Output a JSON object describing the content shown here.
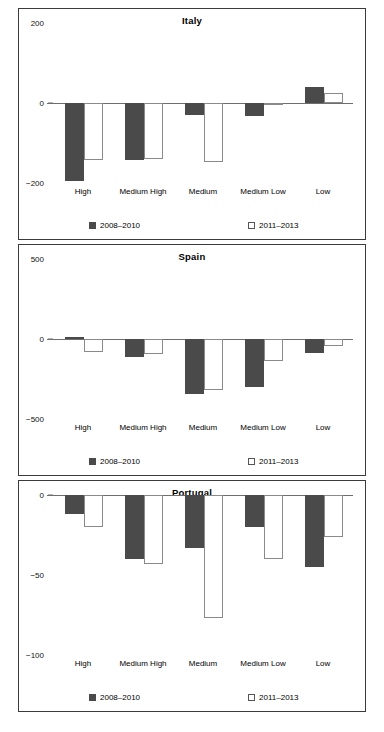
{
  "chart_data": [
    {
      "type": "bar",
      "title": "Italy",
      "categories": [
        "High",
        "Medium High",
        "Medium",
        "Medium Low",
        "Low"
      ],
      "series": [
        {
          "name": "2008–2010",
          "values": [
            -195,
            -142,
            -30,
            -32,
            40
          ],
          "color": "#4a4a4a",
          "fill": "solid"
        },
        {
          "name": "2011–2013",
          "values": [
            -142,
            -140,
            -148,
            -6,
            25
          ],
          "color": "#ffffff",
          "fill": "hollow"
        }
      ],
      "yticks": [
        200,
        0,
        -200
      ],
      "yticklabels": [
        "200",
        "0",
        "−200"
      ],
      "ylim": [
        -200,
        200
      ],
      "xlabel": "",
      "ylabel": "",
      "grid": false,
      "legend_position": "bottom"
    },
    {
      "type": "bar",
      "title": "Spain",
      "categories": [
        "High",
        "Medium High",
        "Medium",
        "Medium Low",
        "Low"
      ],
      "series": [
        {
          "name": "2008–2010",
          "values": [
            15,
            -110,
            -345,
            -300,
            -90
          ],
          "color": "#4a4a4a",
          "fill": "solid"
        },
        {
          "name": "2011–2013",
          "values": [
            -80,
            -95,
            -320,
            -140,
            -45
          ],
          "color": "#ffffff",
          "fill": "hollow"
        }
      ],
      "yticks": [
        500,
        0,
        -500
      ],
      "yticklabels": [
        "500",
        "0",
        "−500"
      ],
      "ylim": [
        -500,
        500
      ],
      "xlabel": "",
      "ylabel": "",
      "grid": false,
      "legend_position": "bottom"
    },
    {
      "type": "bar",
      "title": "Portugal",
      "categories": [
        "High",
        "Medium High",
        "Medium",
        "Medium Low",
        "Low"
      ],
      "series": [
        {
          "name": "2008–2010",
          "values": [
            -12,
            -40,
            -33,
            -20,
            -45
          ],
          "color": "#4a4a4a",
          "fill": "solid"
        },
        {
          "name": "2011–2013",
          "values": [
            -20,
            -43,
            -77,
            -40,
            -26
          ],
          "color": "#ffffff",
          "fill": "hollow"
        }
      ],
      "yticks": [
        0,
        -50,
        -100
      ],
      "yticklabels": [
        "0",
        "−50",
        "−100"
      ],
      "ylim": [
        -100,
        0
      ],
      "xlabel": "",
      "ylabel": "",
      "grid": false,
      "legend_position": "bottom"
    }
  ],
  "legend": {
    "series_1": "2008–2010",
    "series_2": "2011–2013"
  },
  "colors": {
    "series_1": "#4a4a4a",
    "series_2": "#ffffff",
    "axis": "#6e6e6e",
    "border": "#3b3b3b"
  }
}
